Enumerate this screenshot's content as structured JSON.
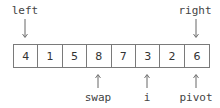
{
  "diagram": {
    "title": "",
    "array": {
      "values": [
        "4",
        "1",
        "5",
        "8",
        "7",
        "3",
        "2",
        "6"
      ]
    },
    "pointers": {
      "left": {
        "label": "left",
        "index": 0,
        "position": "top"
      },
      "right": {
        "label": "right",
        "index": 7,
        "position": "top"
      },
      "swap": {
        "label": "swap",
        "index": 3,
        "position": "bottom"
      },
      "i": {
        "label": "i",
        "index": 5,
        "position": "bottom"
      },
      "pivot": {
        "label": "pivot",
        "index": 7,
        "position": "bottom"
      }
    },
    "colors": {
      "text": "#444444",
      "border": "#7a7a7a",
      "arrow": "#666666",
      "background": "#ffffff"
    }
  }
}
